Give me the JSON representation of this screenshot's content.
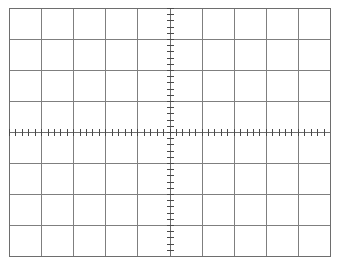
{
  "screen": {
    "kind": "oscilloscope-graticule",
    "width": 343,
    "height": 271,
    "background_color": "#ffffff",
    "label": "",
    "title": ""
  },
  "graticule": {
    "plot_left": 9,
    "plot_top": 8,
    "plot_right": 330,
    "plot_bottom": 256,
    "horizontal_divisions": 10,
    "vertical_divisions": 8,
    "division_width_px": 32.1,
    "division_height_px": 31.0,
    "grid_line_color": "#7f7f7f",
    "grid_line_width": 1,
    "border_color": "#6e6e6e",
    "border_width": 1.2,
    "center_axis_color": "#6e6e6e",
    "center_axis_width": 1.2,
    "subdivisions_per_division": 5,
    "minor_tick_color": "#4a4a4a",
    "minor_tick_width": 1.3,
    "minor_tick_half_length_px": 3.2,
    "center_x": 169,
    "center_y": 132,
    "grid_on": true,
    "labels_visible": false,
    "tick_labels": []
  },
  "chart_data": {
    "type": "line",
    "title": "",
    "subtitle": "",
    "xlabel": "",
    "ylabel": "",
    "legend": [],
    "annotations": [],
    "grid": true,
    "legend_position": "none",
    "x": [],
    "series": [],
    "values": [],
    "categories": [],
    "xlim": [
      -5,
      5
    ],
    "ylim": [
      -4,
      4
    ],
    "x_major_ticks": [
      -5,
      -4,
      -3,
      -2,
      -1,
      0,
      1,
      2,
      3,
      4,
      5
    ],
    "y_major_ticks": [
      -4,
      -3,
      -2,
      -1,
      0,
      1,
      2,
      3,
      4
    ],
    "x_minor_ticks_per_division": 5,
    "y_minor_ticks_per_division": 5,
    "note": "Empty oscilloscope graticule: no trace drawn, 10 horizontal by 8 vertical divisions with centre axes subdivided into fifths."
  }
}
